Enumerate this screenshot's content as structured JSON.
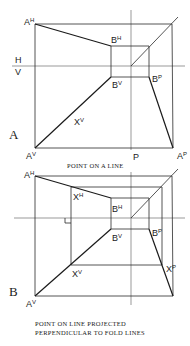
{
  "diagram_a": {
    "letter": "A",
    "caption": "POINT ON A LINE",
    "fold_labels": {
      "h": "H",
      "v": "V",
      "p": "P"
    },
    "points": {
      "a_h": {
        "base": "A",
        "sup": "H"
      },
      "b_h": {
        "base": "B",
        "sup": "H"
      },
      "b_v": {
        "base": "B",
        "sup": "V"
      },
      "b_p": {
        "base": "B",
        "sup": "P"
      },
      "x_v": {
        "base": "X",
        "sup": "V"
      },
      "a_v": {
        "base": "A",
        "sup": "V"
      },
      "a_p": {
        "base": "A",
        "sup": "P"
      }
    }
  },
  "diagram_b": {
    "letter": "B",
    "caption_line1": "POINT ON LINE PROJECTED",
    "caption_line2": "PERPENDICULAR TO FOLD LINES",
    "points": {
      "a_h": {
        "base": "A",
        "sup": "H"
      },
      "x_h": {
        "base": "X",
        "sup": "H"
      },
      "b_h": {
        "base": "B",
        "sup": "H"
      },
      "b_v": {
        "base": "B",
        "sup": "V"
      },
      "b_p": {
        "base": "B",
        "sup": "P"
      },
      "x_p": {
        "base": "X",
        "sup": "P"
      },
      "x_v": {
        "base": "X",
        "sup": "V"
      },
      "a_v": {
        "base": "A",
        "sup": "V"
      }
    }
  }
}
